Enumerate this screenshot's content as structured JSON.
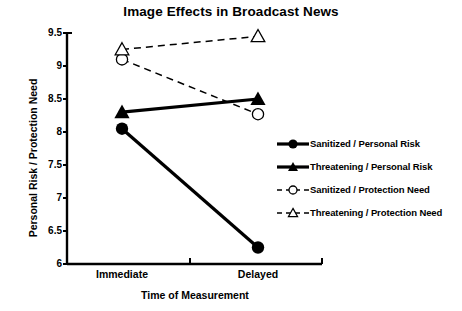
{
  "chart_data": {
    "type": "line",
    "title": "Image Effects in Broadcast News",
    "xlabel": "Time of Measurement",
    "ylabel": "Personal Risk / Protection Need",
    "categories": [
      "Immediate",
      "Delayed"
    ],
    "ylim": [
      6,
      9.5
    ],
    "yticks": [
      "6",
      "6.5",
      "7",
      "7.5",
      "8",
      "8.5",
      "9",
      "9.5"
    ],
    "ytick_values": [
      6,
      6.5,
      7,
      7.5,
      8,
      8.5,
      9,
      9.5
    ],
    "grid": false,
    "legend_position": "right-middle",
    "series": [
      {
        "name": "Sanitized / Personal Risk",
        "values": [
          8.05,
          6.25
        ],
        "marker": "filled-circle",
        "line_style": "solid",
        "color": "#000000"
      },
      {
        "name": "Threatening / Personal Risk",
        "values": [
          8.3,
          8.5
        ],
        "marker": "filled-triangle",
        "line_style": "solid",
        "color": "#000000"
      },
      {
        "name": "Sanitized / Protection Need",
        "values": [
          9.1,
          8.27
        ],
        "marker": "open-circle",
        "line_style": "dashed",
        "color": "#000000"
      },
      {
        "name": "Threatening / Protection Need",
        "values": [
          9.25,
          9.45
        ],
        "marker": "open-triangle",
        "line_style": "dashed",
        "color": "#000000"
      }
    ]
  }
}
